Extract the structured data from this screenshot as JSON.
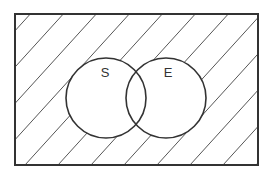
{
  "diagram": {
    "type": "venn",
    "universe": {
      "x": 15,
      "y": 14,
      "width": 243,
      "height": 151,
      "shaded": true
    },
    "sets": [
      {
        "label": "S",
        "cx": 106,
        "cy": 98,
        "r": 40,
        "label_x": 105,
        "label_y": 77
      },
      {
        "label": "E",
        "cx": 166,
        "cy": 98,
        "r": 40,
        "label_x": 168,
        "label_y": 77
      }
    ],
    "shaded_region": "complement of S union E",
    "colors": {
      "stroke": "#333333",
      "hatch": "#555555",
      "background": "#ffffff"
    }
  }
}
